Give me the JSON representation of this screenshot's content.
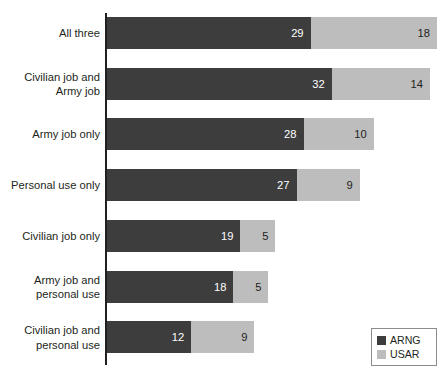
{
  "chart_data": {
    "type": "bar",
    "subtype": "stacked-horizontal",
    "title": "",
    "subtitle": "",
    "xlabel": "",
    "ylabel": "",
    "xlim": [
      0,
      48
    ],
    "grid": false,
    "legend_position": "bottom-right",
    "value_labels": true,
    "categories": [
      "All three",
      "Civilian job and\nArmy job",
      "Army job only",
      "Personal use only",
      "Civilian job only",
      "Army job and\npersonal use",
      "Civilian job and\npersonal use"
    ],
    "series": [
      {
        "name": "ARNG",
        "color": "#3d3d3d",
        "values": [
          29,
          32,
          28,
          27,
          19,
          18,
          12
        ]
      },
      {
        "name": "USAR",
        "color": "#bdbdbd",
        "values": [
          18,
          14,
          10,
          9,
          5,
          5,
          9
        ]
      }
    ],
    "totals": [
      47,
      46,
      38,
      36,
      24,
      23,
      21
    ]
  },
  "legend": {
    "entries": [
      {
        "label": "ARNG",
        "swatch": "arng"
      },
      {
        "label": "USAR",
        "swatch": "usar"
      }
    ]
  },
  "colors": {
    "arng": "#3d3d3d",
    "usar": "#bdbdbd",
    "axis": "#231f20",
    "text": "#231f20",
    "background": "#ffffff",
    "legend_border": "#8c8c8c"
  }
}
